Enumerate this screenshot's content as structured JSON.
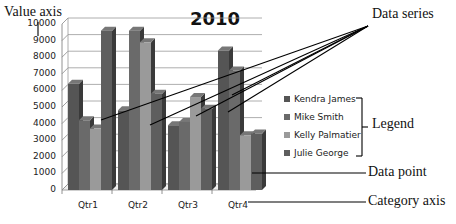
{
  "chart_data": {
    "type": "bar",
    "title": "2010",
    "xlabel": "",
    "ylabel": "",
    "categories": [
      "Qtr1",
      "Qtr2",
      "Qtr3",
      "Qtr4"
    ],
    "series": [
      {
        "name": "Kendra James",
        "values": [
          6400,
          4800,
          3900,
          8400
        ],
        "color": "#555555"
      },
      {
        "name": "Mike Smith",
        "values": [
          4200,
          9600,
          4100,
          7200
        ],
        "color": "#6a6a6a"
      },
      {
        "name": "Kelly Palmatier",
        "values": [
          3700,
          8900,
          5600,
          3300
        ],
        "color": "#9a9a9a"
      },
      {
        "name": "Julie George",
        "values": [
          9600,
          5800,
          4900,
          3400
        ],
        "color": "#5e5e5e"
      }
    ],
    "ylim": [
      0,
      10000
    ],
    "yticks": [
      0,
      1000,
      2000,
      3000,
      4000,
      5000,
      6000,
      7000,
      8000,
      9000,
      10000
    ],
    "grid": true,
    "legend_position": "right",
    "style": "3d-clustered-column"
  },
  "annotations": {
    "value_axis": "Value axis",
    "data_series": "Data series",
    "legend": "Legend",
    "data_point": "Data point",
    "category_axis": "Category axis"
  }
}
